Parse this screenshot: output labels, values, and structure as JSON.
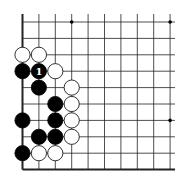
{
  "board": {
    "origin_x": 22.5,
    "origin_y": 22,
    "spacing": 16.4,
    "cols": 10,
    "rows": 10,
    "right_extent": 175,
    "top_extent": 14,
    "edges": {
      "left": true,
      "bottom": true,
      "top": false,
      "right": false
    },
    "star_points": [
      [
        3,
        0
      ],
      [
        9,
        0
      ],
      [
        9,
        6
      ]
    ],
    "stone_radius": 7.6,
    "colors": {
      "black": "#000000",
      "white": "#ffffff",
      "line": "#222222"
    }
  },
  "stones": [
    {
      "color": "white",
      "col": 0,
      "row": 2
    },
    {
      "color": "white",
      "col": 1,
      "row": 2
    },
    {
      "color": "black",
      "col": 0,
      "row": 3
    },
    {
      "color": "black",
      "col": 1,
      "row": 3,
      "label": "1"
    },
    {
      "color": "white",
      "col": 2,
      "row": 3
    },
    {
      "color": "black",
      "col": 1,
      "row": 4
    },
    {
      "color": "white",
      "col": 3,
      "row": 4
    },
    {
      "color": "black",
      "col": 2,
      "row": 5
    },
    {
      "color": "white",
      "col": 3,
      "row": 5
    },
    {
      "color": "black",
      "col": 0,
      "row": 6
    },
    {
      "color": "black",
      "col": 2,
      "row": 6
    },
    {
      "color": "white",
      "col": 3,
      "row": 6
    },
    {
      "color": "black",
      "col": 1,
      "row": 7
    },
    {
      "color": "black",
      "col": 2,
      "row": 7
    },
    {
      "color": "white",
      "col": 3,
      "row": 7
    },
    {
      "color": "black",
      "col": 0,
      "row": 8
    },
    {
      "color": "white",
      "col": 1,
      "row": 8
    },
    {
      "color": "white",
      "col": 2,
      "row": 8
    }
  ]
}
